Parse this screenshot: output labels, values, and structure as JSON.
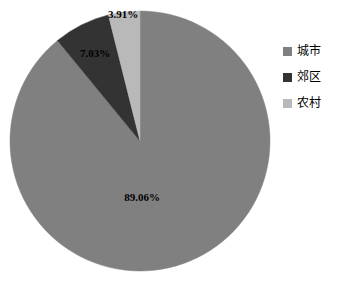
{
  "chart_data": {
    "type": "pie",
    "title": "",
    "labels": [
      "城市",
      "郊区",
      "农村"
    ],
    "values": [
      89.06,
      7.03,
      3.91
    ],
    "value_labels": [
      "89.06%",
      "7.03%",
      "3.91%"
    ],
    "colors": [
      "#808080",
      "#333333",
      "#b9b9b9"
    ],
    "unit": "%",
    "start_angle_deg": 0,
    "direction": "clockwise",
    "legend_position": "right",
    "grid": false,
    "background": "#ffffff",
    "slices": [
      {
        "name": "城市",
        "value": 89.06,
        "value_label": "89.06%",
        "color": "#808080"
      },
      {
        "name": "郊区",
        "value": 7.03,
        "value_label": "7.03%",
        "color": "#333333"
      },
      {
        "name": "农村",
        "value": 3.91,
        "value_label": "3.91%",
        "color": "#b9b9b9"
      }
    ]
  },
  "legend": {
    "items": [
      {
        "label": "城市",
        "color": "#808080"
      },
      {
        "label": "郊区",
        "color": "#333333"
      },
      {
        "label": "农村",
        "color": "#b9b9b9"
      }
    ]
  }
}
